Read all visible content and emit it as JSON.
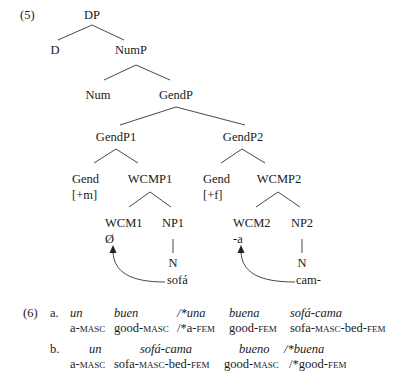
{
  "example5": {
    "label": "(5)",
    "nodes": {
      "dp": "DP",
      "d": "D",
      "nump": "NumP",
      "num": "Num",
      "gendp": "GendP",
      "gendp1": "GendP1",
      "gendp2": "GendP2",
      "gend1": "Gend",
      "gend1_feat": "[+m]",
      "wcmp1": "WCMP1",
      "gend2": "Gend",
      "gend2_feat": "[+f]",
      "wcmp2": "WCMP2",
      "wcm1": "WCM1",
      "wcm1_val": "Ø",
      "np1": "NP1",
      "n1": "N",
      "n1_word": "sofá",
      "wcm2": "WCM2",
      "wcm2_val": "-a",
      "np2": "NP2",
      "n2": "N",
      "n2_word": "cam-"
    }
  },
  "example6": {
    "label": "(6)",
    "a": {
      "label": "a.",
      "words": [
        "un",
        "buen",
        "/*una",
        "buena",
        "sofá-cama"
      ],
      "gloss": [
        {
          "stem": "a-",
          "sc": "masc",
          "tail": ""
        },
        {
          "stem": "good-",
          "sc": "masc",
          "tail": ""
        },
        {
          "stem": "/*a-",
          "sc": "fem",
          "tail": ""
        },
        {
          "stem": "good-",
          "sc": "fem",
          "tail": ""
        },
        {
          "stem": "sofa-",
          "sc": "masc",
          "tail": "-bed-",
          "sc2": "fem"
        }
      ]
    },
    "b": {
      "label": "b.",
      "words": [
        "un",
        "sofá-cama",
        "bueno",
        "/*buena"
      ],
      "gloss": [
        {
          "stem": "a-",
          "sc": "masc"
        },
        {
          "stem": "sofa-",
          "sc": "masc",
          "tail": "-bed-",
          "sc2": "fem"
        },
        {
          "stem": "good-",
          "sc": "masc"
        },
        {
          "stem": "/*good-",
          "sc": "fem"
        }
      ]
    }
  }
}
